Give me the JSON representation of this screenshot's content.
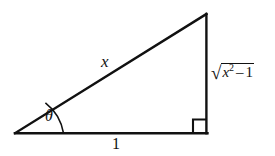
{
  "figure": {
    "name": "right-triangle-trig-substitution",
    "background_color": "#ffffff",
    "stroke_color": "#111111",
    "labels": {
      "hypotenuse": "x",
      "base": "1",
      "angle": "θ",
      "opposite_variable": "x",
      "opposite_exponent": "2",
      "opposite_operator": "–",
      "opposite_constant": "1"
    },
    "markers": {
      "right_angle": "right-angle-square",
      "angle_arc": "angle-arc"
    }
  },
  "geometry": {
    "vertices": {
      "left": [
        15,
        133
      ],
      "bottom_right": [
        207,
        133
      ],
      "top_right": [
        206,
        14
      ]
    },
    "stroke_width": 2.2
  }
}
